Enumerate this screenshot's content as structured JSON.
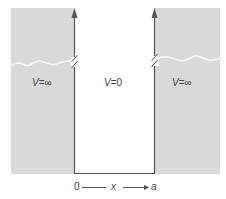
{
  "diagram": {
    "colors": {
      "background": "#ffffff",
      "region_fill": "#d9d9d9",
      "wall_stroke": "#555555",
      "break_line": "#f5f5f5",
      "text": "#444444"
    },
    "regions": [
      {
        "id": "left",
        "potential_symbol": "V",
        "potential_value": "∞",
        "label": "V=∞"
      },
      {
        "id": "middle",
        "potential_symbol": "V",
        "potential_value": "0",
        "label": "V=0"
      },
      {
        "id": "right",
        "potential_symbol": "V",
        "potential_value": "∞",
        "label": "V=∞"
      }
    ],
    "axis": {
      "start_label": "0",
      "variable_label": "x",
      "end_label": "a"
    }
  }
}
